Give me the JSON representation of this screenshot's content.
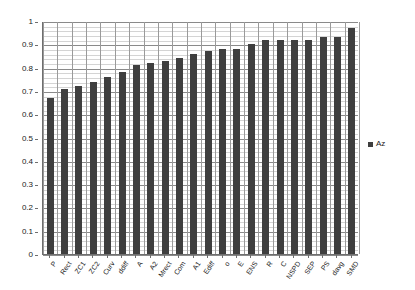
{
  "chart_data": {
    "type": "bar",
    "title": "",
    "subtitle": "",
    "xlabel": "",
    "ylabel": "",
    "ylim": [
      0,
      1
    ],
    "ytick_labels": [
      "0",
      "0.1",
      "0.2",
      "0.3",
      "0.4",
      "0.5",
      "0.6",
      "0.7",
      "0.8",
      "0.9",
      "1"
    ],
    "ytick_values": [
      0,
      0.1,
      0.2,
      0.3,
      0.4,
      0.5,
      0.6,
      0.7,
      0.8,
      0.9,
      1
    ],
    "minor_tick_step": 0.02,
    "grid": true,
    "legend_position": "right",
    "legend": [
      "Az"
    ],
    "bar_color": "#3f3f3f",
    "gridline_color": "#d4d4d4",
    "axis_color": "#6e6e6e",
    "categories": [
      "P",
      "Rect",
      "ZC1",
      "ZC2",
      "Curv",
      "ddiff",
      "A",
      "A2",
      "Mrect",
      "Com",
      "A1",
      "Ediff",
      "o",
      "E",
      "ENS",
      "R",
      "C",
      "NSPD",
      "SEP",
      "PS",
      "davg",
      "SMD"
    ],
    "series": [
      {
        "name": "Az",
        "values": [
          0.67,
          0.71,
          0.72,
          0.74,
          0.76,
          0.78,
          0.81,
          0.82,
          0.83,
          0.84,
          0.86,
          0.87,
          0.88,
          0.88,
          0.9,
          0.92,
          0.92,
          0.92,
          0.92,
          0.93,
          0.93,
          0.97
        ]
      }
    ]
  }
}
